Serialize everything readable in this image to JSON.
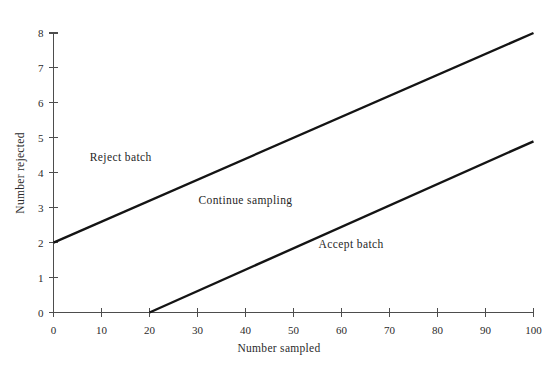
{
  "chart_data": {
    "type": "line",
    "title": "",
    "xlabel": "Number sampled",
    "ylabel": "Number rejected",
    "xlim": [
      0,
      100
    ],
    "ylim": [
      0,
      8
    ],
    "grid": false,
    "legend": "none",
    "xticks": [
      0,
      10,
      20,
      30,
      40,
      50,
      60,
      70,
      80,
      90,
      100
    ],
    "xtick_labels": [
      "0",
      "10",
      "20",
      "30",
      "40",
      "50",
      "60",
      "70",
      "80",
      "90",
      "100"
    ],
    "yticks": [
      0,
      1,
      2,
      3,
      4,
      5,
      6,
      7,
      8
    ],
    "ytick_labels": [
      "0",
      "1",
      "2",
      "3",
      "4",
      "5",
      "6",
      "7",
      "8"
    ],
    "series": [
      {
        "name": "Reject limit line",
        "points": [
          [
            0,
            2
          ],
          [
            100,
            8
          ]
        ],
        "intercept": 2,
        "slope": 0.06,
        "color": "#141414"
      },
      {
        "name": "Accept limit line",
        "points": [
          [
            20,
            0
          ],
          [
            100,
            4.9
          ]
        ],
        "intercept": -1.225,
        "slope": 0.06125,
        "color": "#141414"
      }
    ],
    "annotations": [
      {
        "text": "Reject batch",
        "x": 14,
        "y": 4.35
      },
      {
        "text": "Continue sampling",
        "x": 40,
        "y": 3.1
      },
      {
        "text": "Accept batch",
        "x": 62,
        "y": 1.85
      }
    ]
  },
  "axes": {
    "y_title": "Number rejected",
    "x_title": "Number sampled"
  }
}
